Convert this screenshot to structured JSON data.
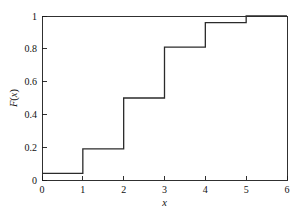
{
  "chart_data": {
    "type": "line",
    "subtype": "step-post",
    "title": "",
    "xlabel": "x",
    "ylabel": "F(x)",
    "xlim": [
      0,
      6
    ],
    "ylim": [
      0,
      1
    ],
    "grid": false,
    "legend": null,
    "x_ticks": [
      0,
      1,
      2,
      3,
      4,
      5,
      6
    ],
    "x_tick_labels": [
      "0",
      "1",
      "2",
      "3",
      "4",
      "5",
      "6"
    ],
    "y_ticks": [
      0,
      0.2,
      0.4,
      0.6,
      0.8,
      1
    ],
    "y_tick_labels": [
      "0",
      "0.2",
      "0.4",
      "0.6",
      "0.8",
      "1"
    ],
    "series": [
      {
        "name": "F(x)",
        "color": "#2b2b2b",
        "x": [
          0,
          1,
          2,
          3,
          4,
          5,
          6
        ],
        "values": [
          0.04,
          0.19,
          0.5,
          0.81,
          0.96,
          1.0,
          1.0
        ]
      }
    ],
    "steps": [
      {
        "from_x": 0,
        "to_x": 1,
        "level": 0.04
      },
      {
        "from_x": 1,
        "to_x": 2,
        "level": 0.19
      },
      {
        "from_x": 2,
        "to_x": 3,
        "level": 0.5
      },
      {
        "from_x": 3,
        "to_x": 4,
        "level": 0.81
      },
      {
        "from_x": 4,
        "to_x": 5,
        "level": 0.96
      },
      {
        "from_x": 5,
        "to_x": 6,
        "level": 1.0
      }
    ],
    "colors": {
      "line": "#2b2b2b",
      "axis": "#1a1a1a",
      "background": "#ffffff",
      "text": "#111111"
    }
  },
  "axes": {
    "x_title": "x",
    "y_title_parts": {
      "f": "F",
      "open": "(",
      "var": "x",
      "close": ")"
    },
    "y_title": "F(x)"
  },
  "ticks": {
    "x": [
      "0",
      "1",
      "2",
      "3",
      "4",
      "5",
      "6"
    ],
    "y": [
      "0",
      "0.2",
      "0.4",
      "0.6",
      "0.8",
      "1"
    ]
  }
}
